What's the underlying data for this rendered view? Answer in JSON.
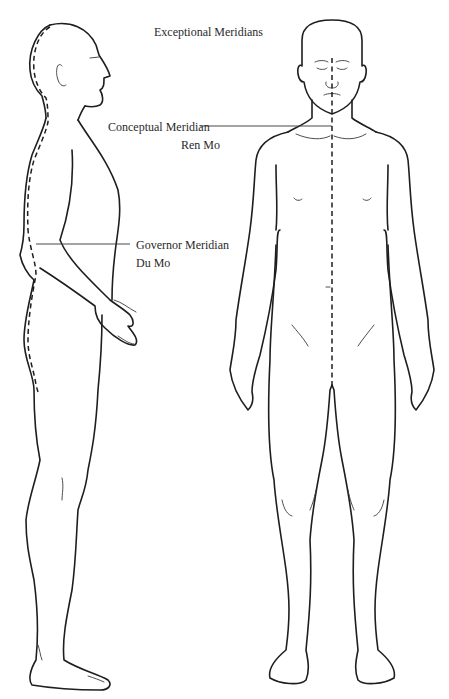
{
  "title": "Exceptional Meridians",
  "labels": {
    "conceptual_name": "Conceptual Meridian",
    "conceptual_alias": "Ren Mo",
    "governor_name": "Governor Meridian",
    "governor_alias": "Du Mo"
  },
  "figures": [
    {
      "view": "side",
      "meridian": "Governor Meridian (Du Mo)",
      "path": "back midline"
    },
    {
      "view": "front",
      "meridian": "Conceptual Meridian (Ren Mo)",
      "path": "front midline"
    }
  ],
  "colors": {
    "line": "#1e1e1e",
    "text": "#2a2a2a",
    "background": "#ffffff"
  }
}
